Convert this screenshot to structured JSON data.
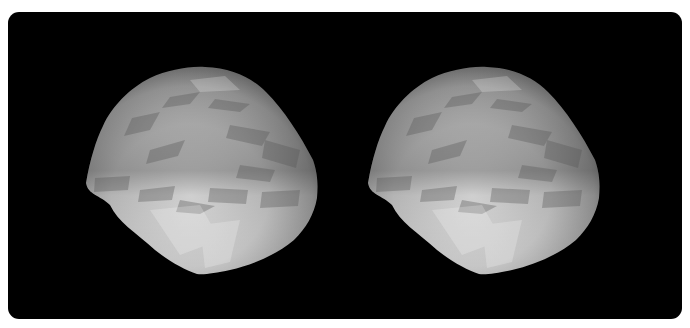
{
  "figure": {
    "type": "stereo-pair",
    "background_color": "#000000",
    "page_color": "#ffffff",
    "views": [
      {
        "name": "left-view",
        "offset_x": 0
      },
      {
        "name": "right-view",
        "offset_x": 282
      }
    ],
    "colors": {
      "light": "#dcdcdc",
      "mid": "#a9a9a9",
      "dark": "#6f6f6f",
      "shadow": "#4a4a4a"
    }
  }
}
